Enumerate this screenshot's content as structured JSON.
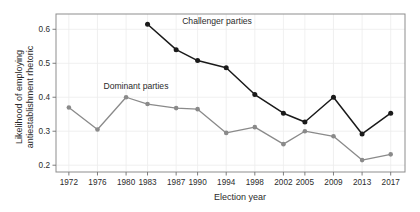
{
  "chart_data": {
    "type": "line",
    "title": "",
    "xlabel": "Election year",
    "ylabel": "Likelihood of employing antiestablishment rhetoric",
    "ylabel_line1": "Likelihood of employing",
    "ylabel_line2": "antiestablishment rhetoric",
    "categories": [
      "1972",
      "1976",
      "1980",
      "1983",
      "1987",
      "1990",
      "1994",
      "1998",
      "2002",
      "2005",
      "2009",
      "2013",
      "2017"
    ],
    "x": [
      1972,
      1976,
      1980,
      1983,
      1987,
      1990,
      1994,
      1998,
      2002,
      2005,
      2009,
      2013,
      2017
    ],
    "ylim": [
      0.18,
      0.645
    ],
    "xlim": [
      1970.2,
      2019.0
    ],
    "yticks": [
      0.2,
      0.3,
      0.4,
      0.5,
      0.6
    ],
    "ytick_labels": [
      "0.2",
      "0.3",
      "0.4",
      "0.5",
      "0.6"
    ],
    "grid": true,
    "legend": "inline-annotations",
    "series": [
      {
        "name": "Challenger parties",
        "color": "#1a1a1a",
        "marker": "filled-circle",
        "x": [
          1983,
          1987,
          1990,
          1994,
          1998,
          2002,
          2005,
          2009,
          2013,
          2017
        ],
        "values": [
          0.615,
          0.54,
          0.508,
          0.487,
          0.408,
          0.353,
          0.327,
          0.4,
          0.292,
          0.353
        ],
        "label_x": 1987,
        "label_y": 0.625
      },
      {
        "name": "Dominant parties",
        "color": "#8a8a8a",
        "marker": "filled-circle",
        "x": [
          1972,
          1976,
          1980,
          1983,
          1987,
          1990,
          1994,
          1998,
          2002,
          2005,
          2009,
          2013,
          2017
        ],
        "values": [
          0.37,
          0.305,
          0.4,
          0.38,
          0.368,
          0.365,
          0.295,
          0.312,
          0.262,
          0.3,
          0.285,
          0.215,
          0.232
        ],
        "label_x": 1976,
        "label_y": 0.434
      }
    ]
  }
}
